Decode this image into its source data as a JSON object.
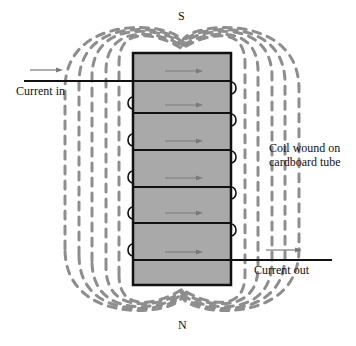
{
  "labels": {
    "south_pole": "S",
    "north_pole": "N",
    "current_in": "Current in",
    "current_out": "Current out",
    "coil_line1": "Coil wound on",
    "coil_line2": "cardboard tube"
  },
  "colors": {
    "tube_fill": "#a9a9a9",
    "field_line": "#8e8e8e",
    "wire": "#111111",
    "arrow": "#7a7a7a"
  },
  "coil": {
    "x": 133,
    "y": 53,
    "width": 98,
    "height": 232,
    "winding_ys": [
      81,
      113,
      150,
      187,
      223,
      260
    ],
    "arrow_ys": [
      71,
      105,
      141,
      178,
      213,
      252
    ],
    "left_loop_ys": [
      103,
      140,
      177,
      213,
      250
    ],
    "right_loop_ys": [
      88,
      120,
      157,
      193,
      230
    ]
  }
}
